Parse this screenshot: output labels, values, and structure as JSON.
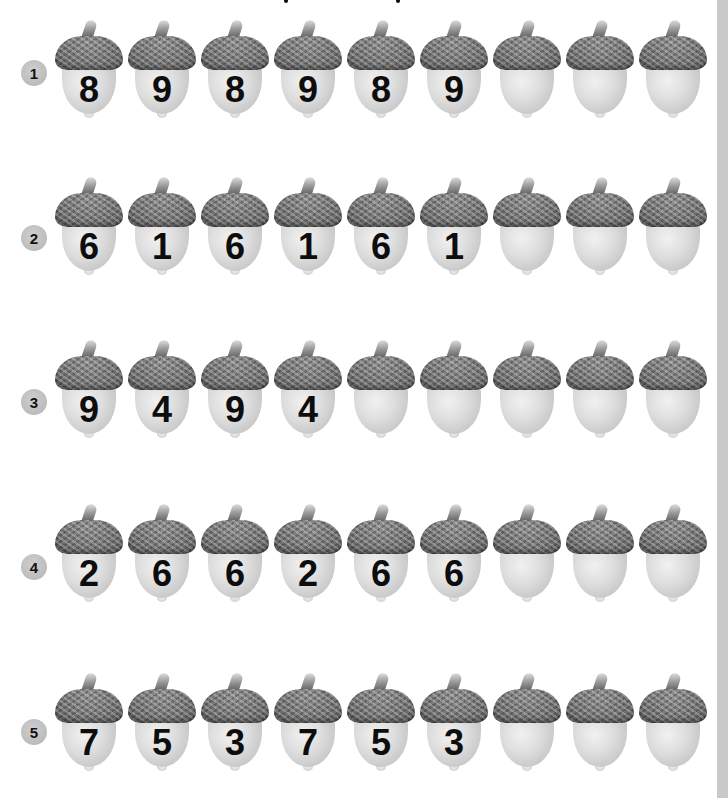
{
  "worksheet": {
    "rows": [
      {
        "label": "1",
        "acorns": [
          "8",
          "9",
          "8",
          "9",
          "8",
          "9",
          "",
          "",
          ""
        ]
      },
      {
        "label": "2",
        "acorns": [
          "6",
          "1",
          "6",
          "1",
          "6",
          "1",
          "",
          "",
          ""
        ]
      },
      {
        "label": "3",
        "acorns": [
          "9",
          "4",
          "9",
          "4",
          "",
          "",
          "",
          "",
          ""
        ]
      },
      {
        "label": "4",
        "acorns": [
          "2",
          "6",
          "6",
          "2",
          "6",
          "6",
          "",
          "",
          ""
        ]
      },
      {
        "label": "5",
        "acorns": [
          "7",
          "5",
          "3",
          "7",
          "5",
          "3",
          "",
          "",
          ""
        ]
      }
    ]
  },
  "colors": {
    "badge": "#bdbdbd",
    "digit": "#0d0d0d",
    "edge_strip": "#c9c9c9",
    "background": "#ffffff"
  },
  "icons": {
    "acorn": "acorn-icon",
    "badge": "circle-number-badge"
  }
}
